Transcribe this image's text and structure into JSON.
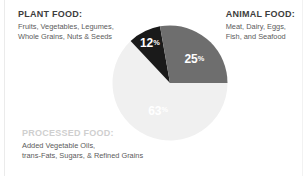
{
  "chart_data": {
    "type": "pie",
    "title": "",
    "legend_position": "callouts",
    "categories": [
      "Animal Food",
      "Processed Food",
      "Plant Food"
    ],
    "values": [
      25,
      63,
      12
    ],
    "unit": "%",
    "colors": [
      "#6e6e6e",
      "#f0f0f0",
      "#1a1a1a"
    ],
    "start_angle_deg": 0,
    "direction": "clockwise",
    "slices": [
      {
        "name": "Animal Food",
        "value": 25,
        "label": "25",
        "percent_symbol": "%",
        "color": "#6e6e6e",
        "label_color": "#ffffff",
        "start_deg": 0,
        "end_deg": 90
      },
      {
        "name": "Processed Food",
        "value": 63,
        "label": "63",
        "percent_symbol": "%",
        "color": "#f0f0f0",
        "label_color": "#fbfbfb",
        "start_deg": 90,
        "end_deg": 316.8
      },
      {
        "name": "Plant Food",
        "value": 12,
        "label": "12",
        "percent_symbol": "%",
        "color": "#1a1a1a",
        "label_color": "#ffffff",
        "start_deg": 316.8,
        "end_deg": 350
      },
      {
        "name": "Animal Food Sliver",
        "value": 0,
        "label": "",
        "percent_symbol": "",
        "color": "#6e6e6e",
        "label_color": "#ffffff",
        "start_deg": 350,
        "end_deg": 360
      }
    ]
  },
  "callouts": {
    "plant_food": {
      "heading": "PLANT FOOD:",
      "line1": "Fruits, Vegetables, Legumes,",
      "line2": "Whole Grains, Nuts & Seeds"
    },
    "animal_food": {
      "heading": "ANIMAL FOOD:",
      "line1": "Meat, Dairy, Eggs,",
      "line2": "Fish, and Seafood"
    },
    "processed_food": {
      "heading": "PROCESSED FOOD:",
      "line1": "Added Vegetable Oils,",
      "line2": "trans-Fats, Sugars, & Refined Grains"
    }
  },
  "colors": {
    "background": "#ffffff",
    "heading_dark": "#3d3d3d",
    "body_text": "#5b5b5b",
    "heading_light": "#cfcfcf",
    "animal_slice": "#6e6e6e",
    "processed_slice": "#f0f0f0",
    "plant_slice": "#1a1a1a"
  }
}
